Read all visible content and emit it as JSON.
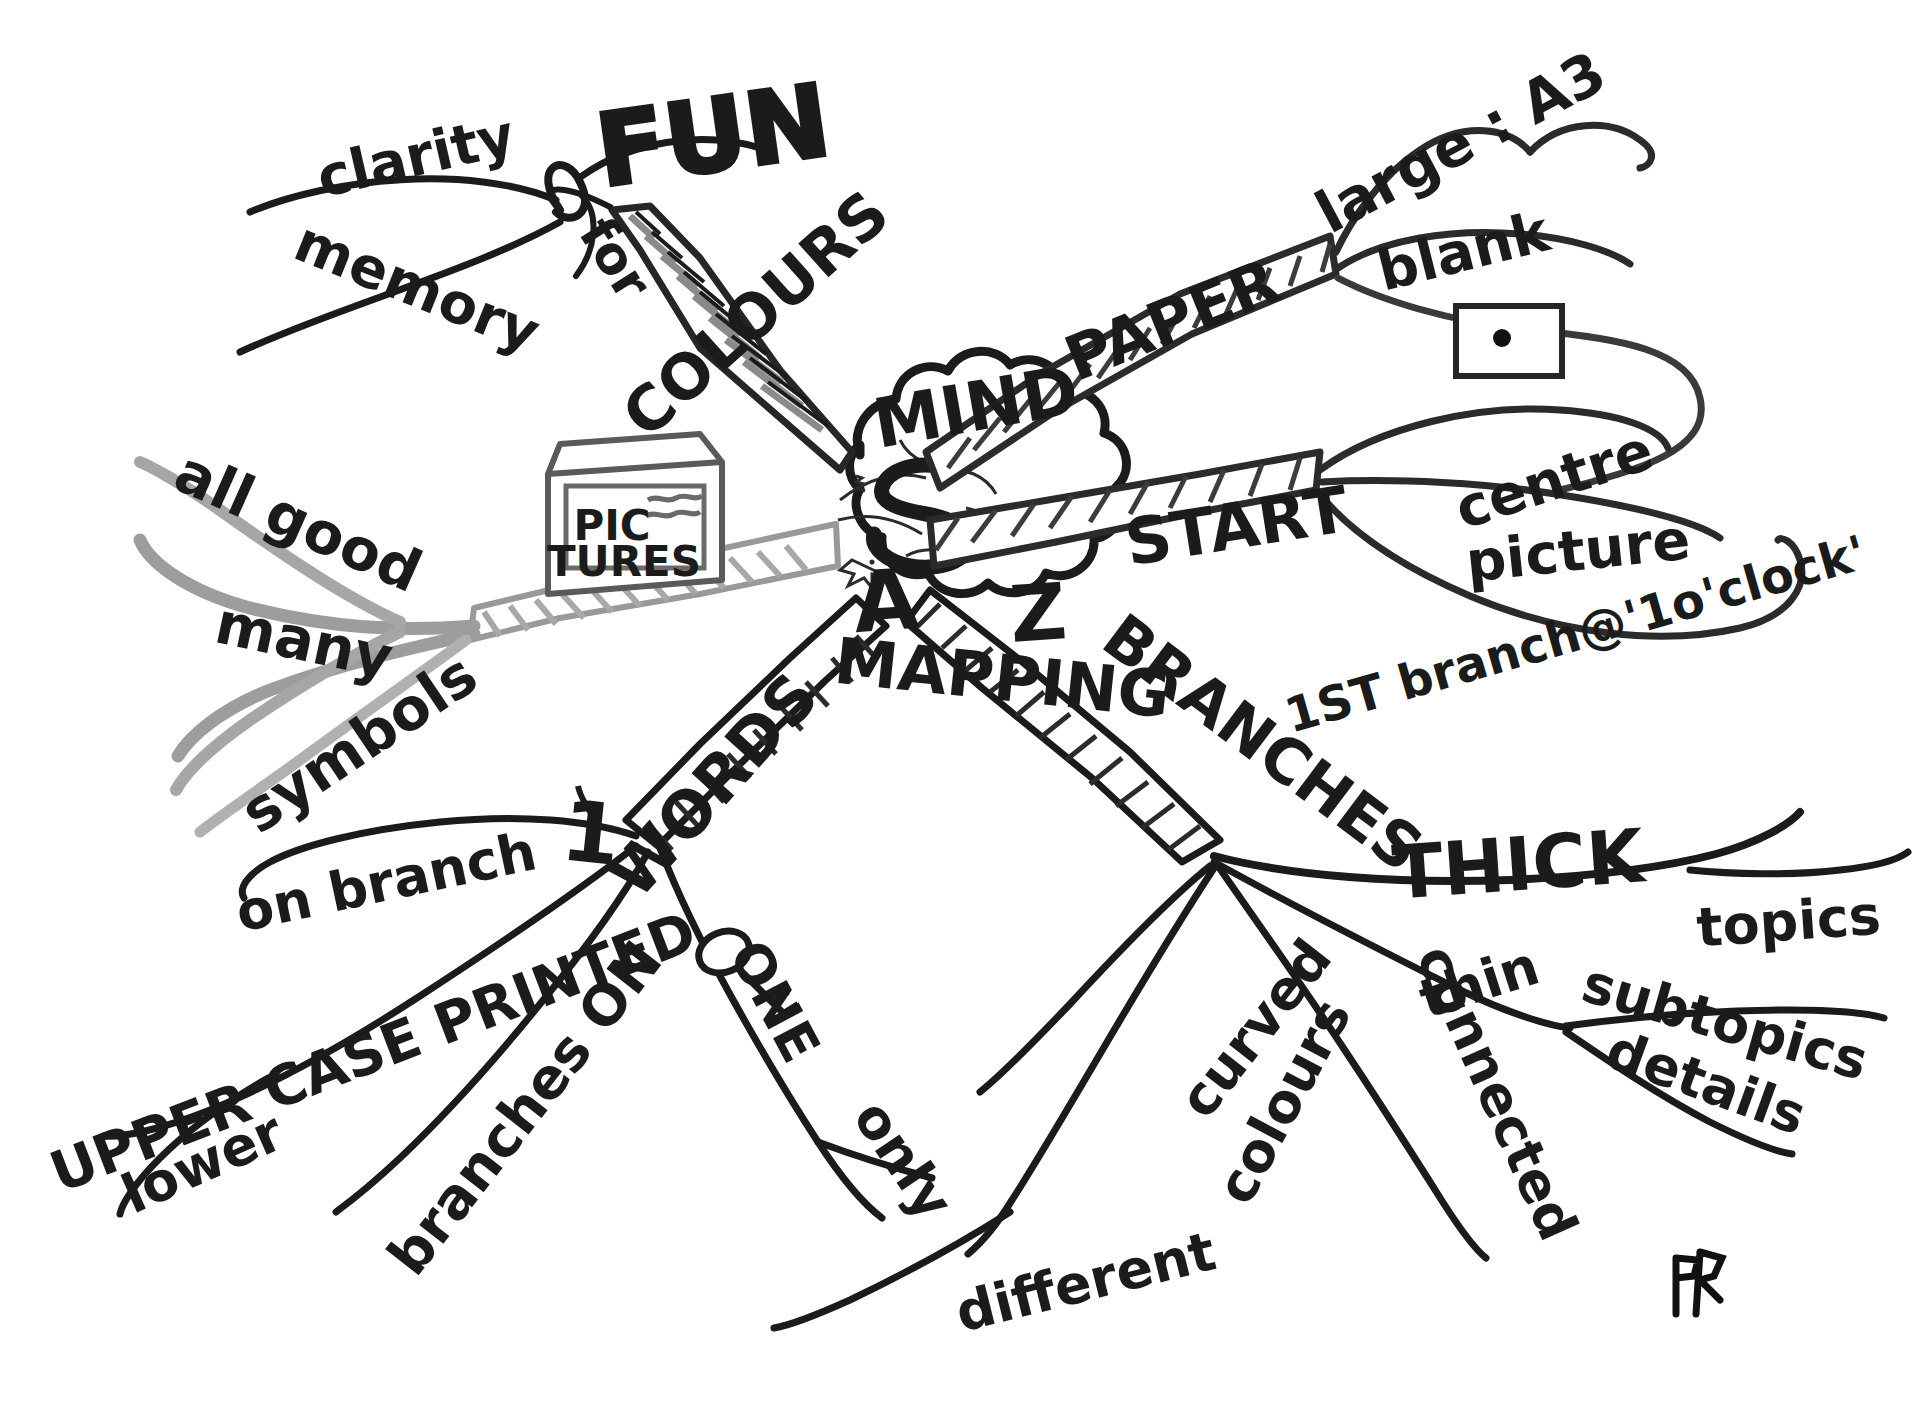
{
  "signature": "EN",
  "center": {
    "line1": "A",
    "squiggle": "to",
    "line2": "Z",
    "word_top": "MIND",
    "word_bottom": "MAPPING",
    "shape": "cloud-burst-brain"
  },
  "icons": {
    "pictures_box": {
      "line1": "PIC",
      "line2": "TURES",
      "name": "pictures-box-icon"
    },
    "key": {
      "name": "key-icon"
    },
    "paper_sheet": {
      "name": "blank-paper-with-dot-icon"
    }
  },
  "branches": [
    {
      "id": "colours",
      "label": "COLOURS",
      "colour": "#6e6e6e",
      "direction": "upper-left",
      "children": [
        {
          "label": "for",
          "children": []
        },
        {
          "label": "clarity",
          "children": []
        },
        {
          "label": "memory",
          "children": []
        },
        {
          "label": "FUN",
          "children": []
        }
      ]
    },
    {
      "id": "pictures",
      "label": "PICTURES",
      "colour": "#9a9a9a",
      "direction": "left",
      "children": [
        {
          "label": "all good",
          "children": []
        },
        {
          "label": "many",
          "children": []
        },
        {
          "label": "symbols",
          "children": []
        }
      ]
    },
    {
      "id": "paper",
      "label": "PAPER",
      "colour": "#3a3a3a",
      "direction": "upper-right",
      "children": [
        {
          "label": "large : A3",
          "children": []
        },
        {
          "label": "blank",
          "children": []
        }
      ]
    },
    {
      "id": "start",
      "label": "START",
      "colour": "#3a3a3a",
      "direction": "right",
      "children": [
        {
          "label": "centre",
          "children": []
        },
        {
          "label": "picture",
          "children": []
        },
        {
          "label": "1ST branch@'1o'clock'",
          "children": []
        }
      ]
    },
    {
      "id": "branches",
      "label": "BRANCHES",
      "colour": "#1b1b1b",
      "direction": "lower-right",
      "children": [
        {
          "label": "THICK",
          "children": [
            {
              "label": "topics"
            }
          ]
        },
        {
          "label": "thin",
          "children": [
            {
              "label": "subtopics"
            },
            {
              "label": "details"
            }
          ]
        },
        {
          "label": "curved",
          "children": []
        },
        {
          "label": "colours",
          "children": [
            {
              "label": "different"
            }
          ]
        },
        {
          "label": "connected",
          "children": []
        }
      ]
    },
    {
      "id": "words",
      "label": "WORDS",
      "colour": "#1b1b1b",
      "direction": "lower-left",
      "children": [
        {
          "label": "on branch",
          "children": []
        },
        {
          "label": "1",
          "children": []
        },
        {
          "label": "UPPER CASE PRINTED",
          "children": []
        },
        {
          "label": "lower",
          "children": []
        },
        {
          "label": "branches ON",
          "children": []
        },
        {
          "label": "ONE only",
          "children": []
        }
      ]
    }
  ],
  "labels": {
    "clarity": "clarity",
    "memory": "memory",
    "for": "for",
    "fun": "FUN",
    "colours": "COLOURS",
    "mind": "MIND",
    "mapping": "MAPPING",
    "paper": "PAPER",
    "large_a3": "large : A3",
    "blank": "blank",
    "start": "START",
    "centre": "centre",
    "picture": "picture",
    "first_branch": "1ST branch@'1o'clock'",
    "all_good": "all good",
    "many": "many",
    "symbols": "symbols",
    "pic": "PIC",
    "tures": "TURES",
    "branches": "BRANCHES",
    "thick": "THICK",
    "topics": "topics",
    "thin": "thin",
    "subtopics": "subtopics",
    "details": "details",
    "curved": "curved",
    "colours_sub": "colours",
    "different": "different",
    "connected": "connected",
    "words": "WORDS",
    "on_branch": "on branch",
    "one_digit": "1",
    "upper_case_printed": "UPPER CASE PRINTED",
    "lower": "lower",
    "branches_on": "branches ON",
    "one": "ONE",
    "only": "only",
    "a": "A",
    "z": "Z",
    "signature": "EN"
  },
  "colors": {
    "ink": "#1b1b1b",
    "dark_grey": "#3a3a3a",
    "mid_grey": "#6e6e6e",
    "light_grey": "#9a9a9a",
    "paper": "#ffffff"
  }
}
